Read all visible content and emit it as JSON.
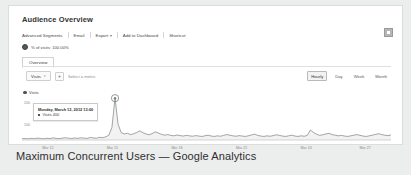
{
  "report": {
    "title": "Audience Overview",
    "corner_icon": "grid-icon"
  },
  "toolbar": {
    "items": [
      {
        "label": "Advanced Segments",
        "caret": false
      },
      {
        "label": "Email",
        "caret": false
      },
      {
        "label": "Export",
        "caret": true
      },
      {
        "label": "Add to Dashboard",
        "caret": false
      },
      {
        "label": "Shortcut",
        "caret": false
      }
    ]
  },
  "sampling": {
    "label": "% of visits: 100.00%"
  },
  "tabs": {
    "overview": "Overview"
  },
  "metric_bar": {
    "selected_metric": "Visits",
    "caret": "▾",
    "add_label": "+",
    "hint": "Select a metric"
  },
  "granularity": {
    "options": [
      "Hourly",
      "Day",
      "Week",
      "Month"
    ],
    "selected": "Hourly"
  },
  "legend": {
    "series_label": "Visits"
  },
  "tooltip": {
    "date": "Monday, March 12, 2012 13:00",
    "metric": "Visits",
    "value": "400"
  },
  "caption": {
    "text": "Maximum Concurrent Users — Google Analytics"
  },
  "colors": {
    "line": "#7b7f83",
    "fill": "#f2f2f2",
    "accent": "#4f5357",
    "axis": "#c9c9c9",
    "page_bg": "#eceded",
    "card_bg": "#ffffff"
  },
  "chart_data": {
    "type": "area",
    "title": "Visits",
    "xlabel": "",
    "ylabel": "Visits",
    "ylim": [
      0,
      440
    ],
    "yticks": [
      200,
      100
    ],
    "ytick_labels": [
      "200",
      "100"
    ],
    "grid": false,
    "legend_position": "top-left",
    "annotation": {
      "label": "Monday, March 12, 2012 13:00 — Visits 400",
      "x_index": 30,
      "y": 400
    },
    "xtick_labels": [
      "Mar 12",
      "Mar 15",
      "Mar 18",
      "Mar 21",
      "Mar 24",
      "Mar 27"
    ],
    "xtick_positions": [
      0.07,
      0.245,
      0.42,
      0.595,
      0.77,
      0.93
    ],
    "x": [
      0,
      1,
      2,
      3,
      4,
      5,
      6,
      7,
      8,
      9,
      10,
      11,
      12,
      13,
      14,
      15,
      16,
      17,
      18,
      19,
      20,
      21,
      22,
      23,
      24,
      25,
      26,
      27,
      28,
      29,
      30,
      31,
      32,
      33,
      34,
      35,
      36,
      37,
      38,
      39,
      40,
      41,
      42,
      43,
      44,
      45,
      46,
      47,
      48,
      49,
      50,
      51,
      52,
      53,
      54,
      55,
      56,
      57,
      58,
      59,
      60,
      61,
      62,
      63,
      64,
      65,
      66,
      67,
      68,
      69,
      70,
      71,
      72,
      73,
      74,
      75,
      76,
      77,
      78,
      79,
      80,
      81,
      82,
      83,
      84,
      85,
      86,
      87,
      88,
      89,
      90,
      91,
      92,
      93,
      94,
      95,
      96,
      97,
      98,
      99,
      100,
      101,
      102,
      103,
      104,
      105,
      106,
      107,
      108,
      109,
      110,
      111,
      112,
      113,
      114,
      115,
      116,
      117,
      118,
      119
    ],
    "values": [
      12,
      14,
      11,
      16,
      13,
      18,
      15,
      12,
      17,
      14,
      20,
      16,
      13,
      18,
      22,
      17,
      14,
      19,
      16,
      21,
      18,
      15,
      24,
      20,
      17,
      26,
      22,
      30,
      46,
      120,
      400,
      150,
      70,
      58,
      64,
      52,
      60,
      72,
      88,
      70,
      58,
      50,
      62,
      78,
      66,
      54,
      46,
      52,
      44,
      40,
      48,
      42,
      38,
      44,
      40,
      36,
      42,
      38,
      34,
      40,
      46,
      38,
      34,
      40,
      36,
      44,
      52,
      46,
      40,
      36,
      42,
      38,
      34,
      40,
      48,
      56,
      44,
      38,
      34,
      40,
      36,
      42,
      50,
      44,
      38,
      34,
      40,
      46,
      38,
      34,
      40,
      36,
      44,
      96,
      72,
      56,
      44,
      50,
      58,
      64,
      52,
      46,
      40,
      44,
      38,
      34,
      40,
      46,
      52,
      44,
      38,
      34,
      40,
      46,
      54,
      60,
      52,
      46,
      42,
      48
    ],
    "series": [
      {
        "name": "Visits",
        "color": "#7b7f83"
      }
    ]
  }
}
